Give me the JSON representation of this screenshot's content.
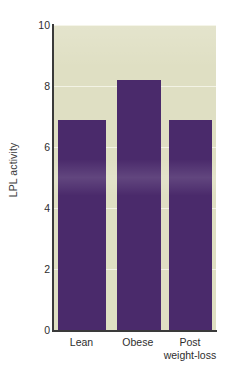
{
  "chart_data": {
    "type": "bar",
    "title": "",
    "subtitle": "",
    "xlabel": "",
    "ylabel": "LPL activity",
    "categories": [
      "Lean",
      "Obese",
      "Post\nweight-loss"
    ],
    "values": [
      6.9,
      8.2,
      6.9
    ],
    "series": [
      {
        "name": "LPL activity",
        "values": [
          6.9,
          8.2,
          6.9
        ]
      }
    ],
    "ylim": [
      0,
      10
    ],
    "yticks": [
      0,
      2,
      4,
      6,
      8,
      10
    ],
    "ytick_labels": [
      "0",
      "2",
      "4",
      "6",
      "8",
      "10"
    ],
    "xtick_labels": [
      "Lean",
      "Obese",
      "Post\nweight-loss"
    ],
    "grid": {
      "horizontal": true,
      "vertical": false,
      "color": "#f4f4e8"
    },
    "legend": {
      "visible": false,
      "position": "none",
      "entries": []
    },
    "annotations": [],
    "colors": {
      "bar": "#4a2a6b",
      "plot_background": "#dfdfc3",
      "figure_background": "#ffffff",
      "axis": "#3a3a3a",
      "text": "#2e2e2e",
      "gridline": "#f4f4e8"
    },
    "bar_layout": [
      {
        "label": "Lean",
        "left_pct": 3.0,
        "width_pct": 29.5,
        "value": 6.9
      },
      {
        "label": "Obese",
        "left_pct": 39.0,
        "width_pct": 27.0,
        "value": 8.2
      },
      {
        "label": "Post weight-loss",
        "left_pct": 71.0,
        "width_pct": 26.5,
        "value": 6.9
      }
    ],
    "xtick_layout": [
      {
        "label": "Lean",
        "center_pct": 17.5
      },
      {
        "label": "Obese",
        "center_pct": 52.0
      },
      {
        "label": "Post\nweight-loss",
        "center_pct": 84.0
      }
    ]
  }
}
